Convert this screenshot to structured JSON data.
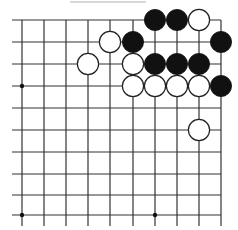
{
  "board": {
    "type": "go-diagram",
    "visible_columns": 10,
    "visible_rows": 10,
    "edges": {
      "top": true,
      "right": true,
      "left": false,
      "bottom": false
    },
    "line_color": "#333333",
    "star_points": [
      [
        0,
        3
      ],
      [
        0,
        9
      ],
      [
        6,
        9
      ]
    ],
    "stones": [
      {
        "color": "black",
        "col": 6,
        "row": 0
      },
      {
        "color": "black",
        "col": 7,
        "row": 0
      },
      {
        "color": "white",
        "col": 8,
        "row": 0
      },
      {
        "color": "white",
        "col": 4,
        "row": 1
      },
      {
        "color": "black",
        "col": 5,
        "row": 1
      },
      {
        "color": "black",
        "col": 9,
        "row": 1
      },
      {
        "color": "white",
        "col": 3,
        "row": 2
      },
      {
        "color": "white",
        "col": 5,
        "row": 2
      },
      {
        "color": "black",
        "col": 6,
        "row": 2
      },
      {
        "color": "black",
        "col": 7,
        "row": 2
      },
      {
        "color": "black",
        "col": 8,
        "row": 2
      },
      {
        "color": "white",
        "col": 5,
        "row": 3
      },
      {
        "color": "white",
        "col": 6,
        "row": 3
      },
      {
        "color": "white",
        "col": 7,
        "row": 3
      },
      {
        "color": "white",
        "col": 8,
        "row": 3
      },
      {
        "color": "black",
        "col": 9,
        "row": 3
      },
      {
        "color": "white",
        "col": 8,
        "row": 5
      }
    ]
  }
}
